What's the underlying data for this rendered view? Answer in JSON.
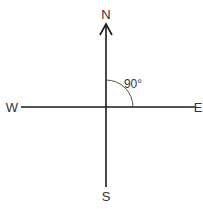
{
  "diagram": {
    "type": "compass",
    "labels": {
      "north": "N",
      "south": "S",
      "east": "E",
      "west": "W"
    },
    "angle": {
      "label": "90°",
      "between": [
        "N",
        "E"
      ],
      "degrees": 90
    },
    "colors": {
      "line": "#1a1a1a",
      "arc": "#555555",
      "text": "#333333",
      "background": "#ffffff"
    }
  }
}
